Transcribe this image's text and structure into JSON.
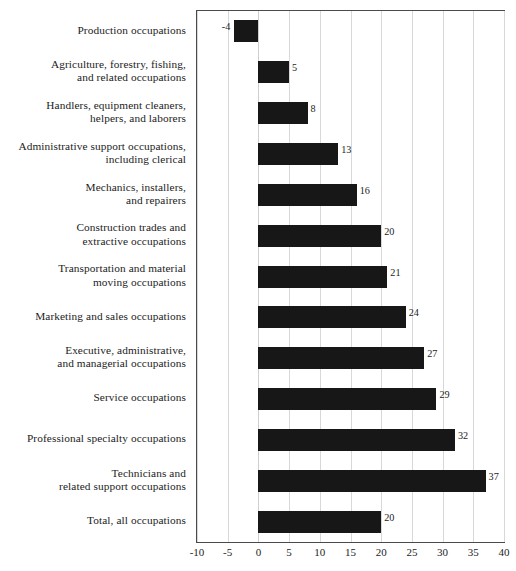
{
  "chart_data": {
    "type": "bar",
    "orientation": "horizontal",
    "title": "",
    "subtitle": "",
    "xlabel": "",
    "ylabel": "",
    "xlim": [
      -10,
      40
    ],
    "xticks": [
      -10,
      -5,
      0,
      5,
      10,
      15,
      20,
      25,
      30,
      35,
      40
    ],
    "xtick_labels": [
      "-10",
      "-5",
      "0",
      "5",
      "10",
      "15",
      "20",
      "25",
      "30",
      "35",
      "40"
    ],
    "grid": "vertical",
    "legend": "none",
    "bar_color": "#171717",
    "categories": [
      "Production occupations",
      "Agriculture, forestry, fishing,\nand related occupations",
      "Handlers, equipment cleaners,\nhelpers, and laborers",
      "Administrative support occupations,\nincluding clerical",
      "Mechanics, installers,\nand repairers",
      "Construction trades and\nextractive occupations",
      "Transportation and material\nmoving occupations",
      "Marketing and sales occupations",
      "Executive, administrative,\nand managerial occupations",
      "Service occupations",
      "Professional specialty occupations",
      "Technicians and\nrelated support occupations",
      "Total, all occupations"
    ],
    "values": [
      -4,
      5,
      8,
      13,
      16,
      20,
      21,
      24,
      27,
      29,
      32,
      37,
      20
    ],
    "value_labels": [
      "-4",
      "5",
      "8",
      "13",
      "16",
      "20",
      "21",
      "24",
      "27",
      "29",
      "32",
      "37",
      "20"
    ]
  },
  "footer": {
    "source_note": ""
  }
}
